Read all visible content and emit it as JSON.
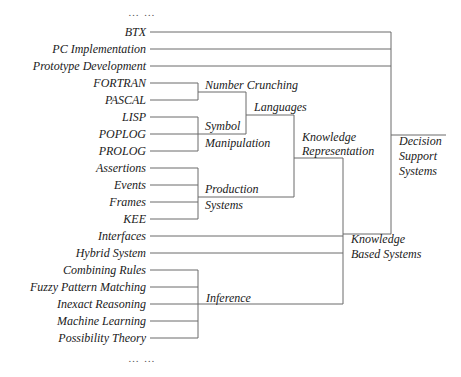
{
  "diagram": {
    "top_ellipsis": "…   …",
    "bottom_ellipsis": "…   …",
    "leaves": [
      {
        "label": "BTX",
        "y": 32
      },
      {
        "label": "PC Implementation",
        "y": 49
      },
      {
        "label": "Prototype Development",
        "y": 66
      },
      {
        "label": "FORTRAN",
        "y": 83
      },
      {
        "label": "PASCAL",
        "y": 100
      },
      {
        "label": "LISP",
        "y": 117
      },
      {
        "label": "POPLOG",
        "y": 134
      },
      {
        "label": "PROLOG",
        "y": 151
      },
      {
        "label": "Assertions",
        "y": 168
      },
      {
        "label": "Events",
        "y": 185
      },
      {
        "label": "Frames",
        "y": 202
      },
      {
        "label": "KEE",
        "y": 219
      },
      {
        "label": "Interfaces",
        "y": 236
      },
      {
        "label": "Hybrid System",
        "y": 253
      },
      {
        "label": "Combining Rules",
        "y": 270
      },
      {
        "label": "Fuzzy Pattern Matching",
        "y": 287
      },
      {
        "label": "Inexact Reasoning",
        "y": 304
      },
      {
        "label": "Machine Learning",
        "y": 321
      },
      {
        "label": "Possibility Theory",
        "y": 338
      }
    ],
    "nodes": {
      "number_crunching": [
        "Number Crunching"
      ],
      "symbol_manipulation": [
        "Symbol",
        "Manipulation"
      ],
      "production_systems": [
        "Production",
        "Systems"
      ],
      "languages": [
        "Languages"
      ],
      "knowledge_representation": [
        "Knowledge",
        "Representation"
      ],
      "inference": [
        "Inference"
      ],
      "knowledge_based_systems": [
        "Knowledge",
        "Based Systems"
      ],
      "decision_support_systems": [
        "Decision",
        "Support",
        "Systems"
      ]
    }
  }
}
